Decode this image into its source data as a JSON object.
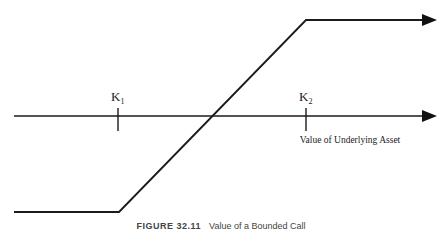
{
  "diagram": {
    "type": "payoff-diagram",
    "axis": {
      "y": 116,
      "x_start": 14,
      "x_end": 436,
      "label": "Value of Underlying Asset"
    },
    "strikes": [
      {
        "label": "K",
        "sub": "1",
        "x": 118
      },
      {
        "label": "K",
        "sub": "2",
        "x": 306
      }
    ],
    "payoff_line": {
      "points": [
        [
          14,
          212
        ],
        [
          119,
          212
        ],
        [
          306,
          20
        ],
        [
          436,
          20
        ]
      ]
    },
    "colors": {
      "line": "#1a1a1a",
      "axis": "#1a1a1a",
      "text": "#222222"
    }
  },
  "caption": {
    "figure_number": "FIGURE 32.11",
    "text": "Value of a Bounded Call"
  }
}
